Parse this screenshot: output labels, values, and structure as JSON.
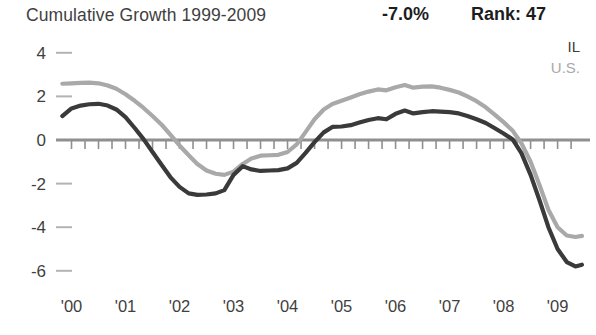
{
  "header": {
    "title": "Cumulative Growth 1999-2009",
    "stat_value": "-7.0%",
    "rank_label": "Rank: 47"
  },
  "legend": {
    "items": [
      {
        "label": "IL",
        "color": "#3a3a3a"
      },
      {
        "label": "U.S.",
        "color": "#a9a9a9"
      }
    ]
  },
  "chart_data": {
    "type": "line",
    "title": "Cumulative Growth 1999-2009",
    "xlabel": "",
    "ylabel": "",
    "xlim": [
      1999.75,
      2009.6
    ],
    "ylim": [
      -6.6,
      4.6
    ],
    "yticks": [
      4,
      2,
      0,
      -2,
      -4,
      -6
    ],
    "ytick_labels": [
      "4",
      "2",
      "0",
      "-2",
      "-4",
      "-6"
    ],
    "xticks": [
      2000,
      2001,
      2002,
      2003,
      2004,
      2005,
      2006,
      2007,
      2008,
      2009
    ],
    "xtick_labels": [
      "'00",
      "'01",
      "'02",
      "'03",
      "'04",
      "'05",
      "'06",
      "'07",
      "'08",
      "'09"
    ],
    "grid": false,
    "zero_line": true,
    "minor_ticks": "quarterly",
    "legend_position": "top-right",
    "annotations": [
      {
        "text": "-7.0%",
        "role": "summary-value"
      },
      {
        "text": "Rank: 47",
        "role": "summary-rank"
      }
    ],
    "x": [
      1999.83,
      2000.0,
      2000.17,
      2000.33,
      2000.5,
      2000.67,
      2000.83,
      2001.0,
      2001.17,
      2001.33,
      2001.5,
      2001.67,
      2001.83,
      2002.0,
      2002.17,
      2002.33,
      2002.5,
      2002.67,
      2002.83,
      2003.0,
      2003.17,
      2003.33,
      2003.5,
      2003.67,
      2003.83,
      2004.0,
      2004.17,
      2004.33,
      2004.5,
      2004.67,
      2004.83,
      2005.0,
      2005.17,
      2005.33,
      2005.5,
      2005.67,
      2005.83,
      2006.0,
      2006.17,
      2006.33,
      2006.5,
      2006.67,
      2006.83,
      2007.0,
      2007.17,
      2007.33,
      2007.5,
      2007.67,
      2007.83,
      2008.0,
      2008.17,
      2008.33,
      2008.5,
      2008.67,
      2008.83,
      2009.0,
      2009.17,
      2009.33,
      2009.45
    ],
    "series": [
      {
        "name": "IL",
        "color": "#3a3a3a",
        "values": [
          1.1,
          1.45,
          1.58,
          1.64,
          1.66,
          1.58,
          1.4,
          1.05,
          0.55,
          0.05,
          -0.55,
          -1.15,
          -1.7,
          -2.15,
          -2.45,
          -2.52,
          -2.5,
          -2.45,
          -2.3,
          -1.6,
          -1.2,
          -1.35,
          -1.42,
          -1.4,
          -1.38,
          -1.3,
          -1.05,
          -0.6,
          -0.1,
          0.35,
          0.6,
          0.62,
          0.68,
          0.8,
          0.92,
          1.0,
          0.95,
          1.2,
          1.35,
          1.22,
          1.28,
          1.32,
          1.3,
          1.28,
          1.22,
          1.1,
          0.95,
          0.78,
          0.55,
          0.3,
          0.02,
          -0.6,
          -1.6,
          -2.8,
          -4.0,
          -5.0,
          -5.6,
          -5.8,
          -5.72
        ]
      },
      {
        "name": "U.S.",
        "color": "#a9a9a9",
        "values": [
          2.58,
          2.6,
          2.62,
          2.63,
          2.6,
          2.5,
          2.35,
          2.1,
          1.8,
          1.48,
          1.1,
          0.7,
          0.25,
          -0.25,
          -0.7,
          -1.1,
          -1.4,
          -1.55,
          -1.6,
          -1.45,
          -1.1,
          -0.85,
          -0.72,
          -0.7,
          -0.68,
          -0.55,
          -0.2,
          0.35,
          0.95,
          1.4,
          1.65,
          1.8,
          1.95,
          2.1,
          2.22,
          2.32,
          2.28,
          2.42,
          2.52,
          2.4,
          2.45,
          2.46,
          2.4,
          2.3,
          2.18,
          2.0,
          1.78,
          1.5,
          1.18,
          0.82,
          0.42,
          -0.15,
          -1.0,
          -2.1,
          -3.2,
          -4.0,
          -4.38,
          -4.45,
          -4.4
        ]
      }
    ]
  }
}
